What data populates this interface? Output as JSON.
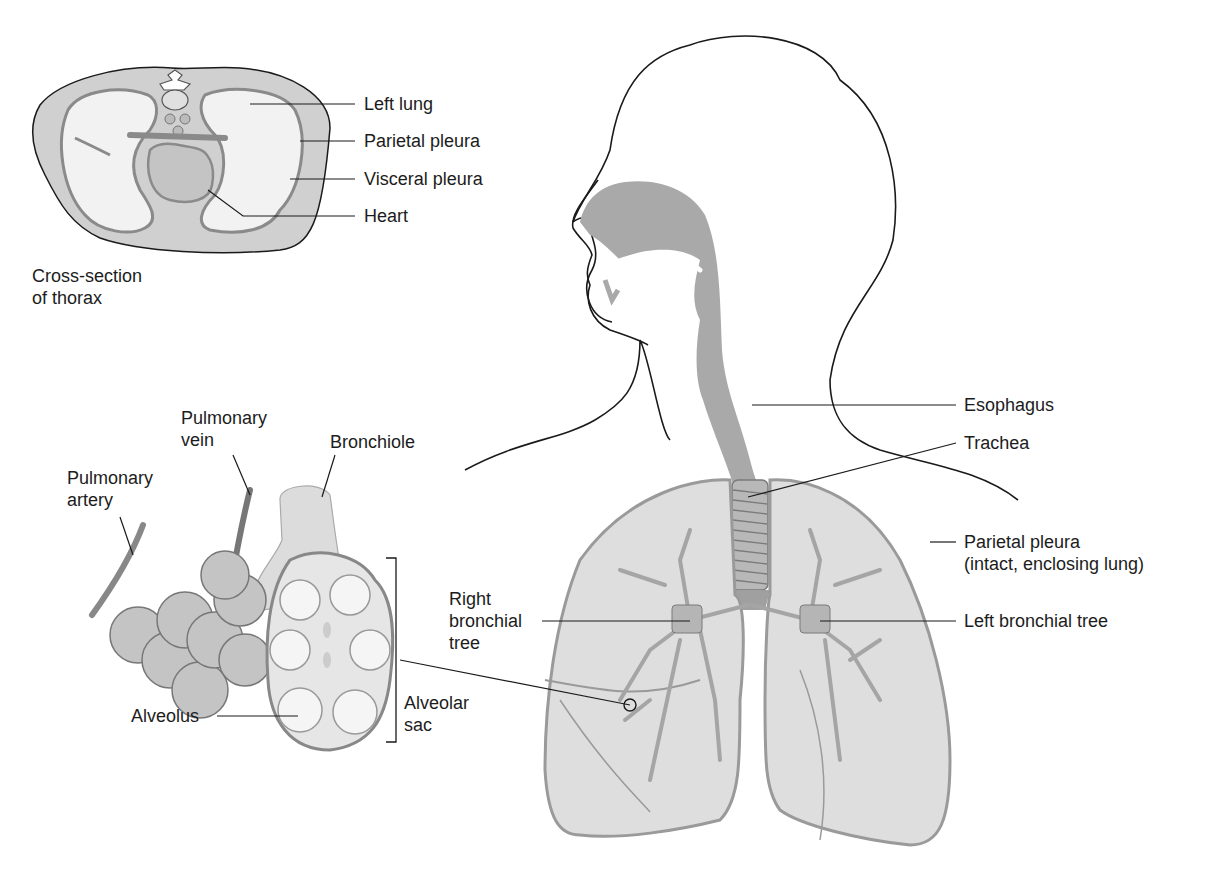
{
  "figure": {
    "colors": {
      "tissue_fill": "#c8c8c8",
      "tissue_dark": "#9a9a9a",
      "airway_fill": "#a9a9a9",
      "lung_fill": "#dedede",
      "outline": "#1a1a1a",
      "background": "#ffffff"
    }
  },
  "cross_section": {
    "caption_line1": "Cross-section",
    "caption_line2": "of thorax",
    "labels": {
      "left_lung": "Left lung",
      "parietal_pleura": "Parietal pleura",
      "visceral_pleura": "Visceral pleura",
      "heart": "Heart"
    }
  },
  "alveoli": {
    "labels": {
      "pulmonary_vein_1": "Pulmonary",
      "pulmonary_vein_2": "vein",
      "pulmonary_artery_1": "Pulmonary",
      "pulmonary_artery_2": "artery",
      "bronchiole": "Bronchiole",
      "alveolus": "Alveolus",
      "alveolar_sac_1": "Alveolar",
      "alveolar_sac_2": "sac"
    }
  },
  "torso": {
    "labels": {
      "esophagus": "Esophagus",
      "trachea": "Trachea",
      "parietal_pleura_1": "Parietal pleura",
      "parietal_pleura_2": "(intact, enclosing lung)",
      "right_bronchial_1": "Right",
      "right_bronchial_2": "bronchial",
      "right_bronchial_3": "tree",
      "left_bronchial": "Left bronchial tree"
    }
  }
}
